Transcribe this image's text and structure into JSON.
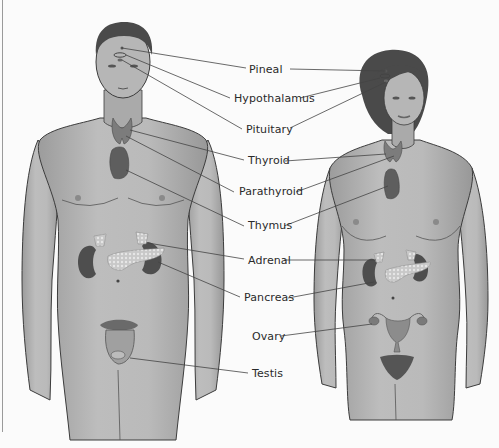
{
  "diagram": {
    "type": "anatomical-illustration",
    "figures": [
      {
        "id": "male",
        "position": "left"
      },
      {
        "id": "female",
        "position": "right"
      }
    ],
    "labels": [
      {
        "text": "Pineal",
        "x": 249,
        "y": 63,
        "targets": [
          "male",
          "female"
        ]
      },
      {
        "text": "Hypothalamus",
        "x": 234,
        "y": 93,
        "targets": [
          "male",
          "female"
        ]
      },
      {
        "text": "Pituitary",
        "x": 246,
        "y": 124,
        "targets": [
          "male",
          "female"
        ]
      },
      {
        "text": "Thyroid",
        "x": 248,
        "y": 154,
        "targets": [
          "male",
          "female"
        ]
      },
      {
        "text": "Parathyroid",
        "x": 239,
        "y": 185,
        "targets": [
          "male",
          "female"
        ]
      },
      {
        "text": "Thymus",
        "x": 248,
        "y": 219,
        "targets": [
          "male",
          "female"
        ]
      },
      {
        "text": "Adrenal",
        "x": 248,
        "y": 254,
        "targets": [
          "male",
          "female"
        ]
      },
      {
        "text": "Pancreas",
        "x": 244,
        "y": 292,
        "targets": [
          "male",
          "female"
        ]
      },
      {
        "text": "Ovary",
        "x": 252,
        "y": 330,
        "targets": [
          "female"
        ]
      },
      {
        "text": "Testis",
        "x": 252,
        "y": 368,
        "targets": [
          "male"
        ]
      }
    ],
    "colors": {
      "background": "#fbfbfb",
      "skin": "#b4b4b4",
      "skin_shadow": "#8f8f8f",
      "outline": "#3c3c3c",
      "hair": "#4a4a4a",
      "gland": "#7a7a7a",
      "gland_dark": "#555555",
      "leader_line": "#444444",
      "label_text": "#2a2a2a"
    }
  }
}
